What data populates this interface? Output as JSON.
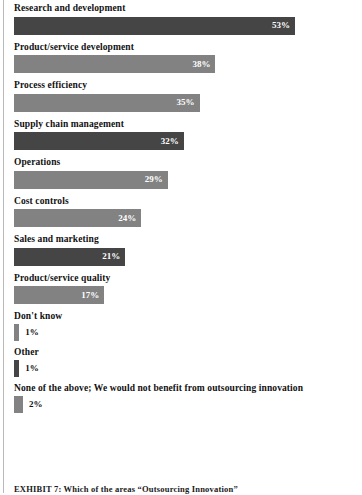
{
  "chart_data": {
    "type": "bar",
    "orientation": "horizontal",
    "title": "",
    "xlabel": "",
    "ylabel": "",
    "xlim": [
      0,
      53
    ],
    "grid": false,
    "legend": false,
    "value_suffix": "%",
    "categories": [
      "Research and development",
      "Product/service development",
      "Process efficiency",
      "Supply chain management",
      "Operations",
      "Cost controls",
      "Sales and marketing",
      "Product/service quality",
      "Don't know",
      "Other",
      "None of the above; We would not benefit from outsourcing innovation"
    ],
    "values": [
      53,
      38,
      35,
      32,
      29,
      24,
      21,
      17,
      1,
      1,
      2
    ],
    "value_labels": [
      "53%",
      "38%",
      "35%",
      "32%",
      "29%",
      "24%",
      "21%",
      "17%",
      "1%",
      "1%",
      "2%"
    ],
    "bar_shades": [
      "dark",
      "light",
      "light",
      "dark",
      "light",
      "light",
      "dark",
      "light",
      "light",
      "dark",
      "light"
    ],
    "colors": {
      "bar_dark": "#454545",
      "bar_light": "#828282",
      "label_text": "#111111",
      "value_text_inside": "#ffffff",
      "background": "#ffffff",
      "rule": "#b9b9b9"
    },
    "rows": [
      {
        "label": "Research and development",
        "value": 53,
        "value_label": "53%",
        "shade": "dark",
        "label_inside": true
      },
      {
        "label": "Product/service development",
        "value": 38,
        "value_label": "38%",
        "shade": "light",
        "label_inside": true
      },
      {
        "label": "Process efficiency",
        "value": 35,
        "value_label": "35%",
        "shade": "light",
        "label_inside": true
      },
      {
        "label": "Supply chain management",
        "value": 32,
        "value_label": "32%",
        "shade": "dark",
        "label_inside": true
      },
      {
        "label": "Operations",
        "value": 29,
        "value_label": "29%",
        "shade": "light",
        "label_inside": true
      },
      {
        "label": "Cost controls",
        "value": 24,
        "value_label": "24%",
        "shade": "light",
        "label_inside": true
      },
      {
        "label": "Sales and marketing",
        "value": 21,
        "value_label": "21%",
        "shade": "dark",
        "label_inside": true
      },
      {
        "label": "Product/service quality",
        "value": 17,
        "value_label": "17%",
        "shade": "light",
        "label_inside": true
      },
      {
        "label": "Don't know",
        "value": 1,
        "value_label": "1%",
        "shade": "light",
        "label_inside": false
      },
      {
        "label": "Other",
        "value": 1,
        "value_label": "1%",
        "shade": "dark",
        "label_inside": false
      },
      {
        "label": "None of the above; We would not benefit from outsourcing innovation",
        "value": 2,
        "value_label": "2%",
        "shade": "light",
        "label_inside": false
      }
    ]
  },
  "caption": {
    "text": "EXHIBIT 7: Which of the areas “Outsourcing Innovation”"
  }
}
